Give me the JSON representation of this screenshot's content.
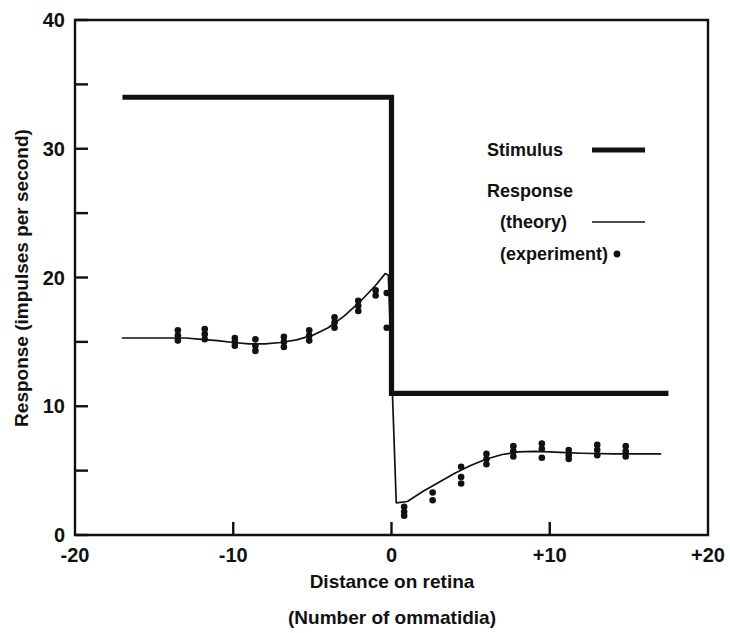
{
  "chart_data": {
    "type": "line",
    "title": "",
    "subtitle": "",
    "xlabel": "Distance on retina",
    "xlabel_sub": "(Number of ommatidia)",
    "ylabel": "Response (impulses per second)",
    "xlim": [
      -20,
      20
    ],
    "ylim": [
      0,
      40
    ],
    "grid": false,
    "x_ticks_major": [
      -20,
      -10,
      0,
      10,
      20
    ],
    "x_tick_labels": [
      "-20",
      "-10",
      "0",
      "+10",
      "+20"
    ],
    "y_ticks_major": [
      0,
      10,
      20,
      30,
      40
    ],
    "y_tick_labels": [
      "0",
      "10",
      "20",
      "30",
      "40"
    ],
    "y_ticks_minor": [
      5,
      15,
      25,
      35
    ],
    "legend_position": "upper-right-inside",
    "legend": [
      {
        "label": "Stimulus",
        "style": "thick-line"
      },
      {
        "label": "Response",
        "style": "group-header"
      },
      {
        "label": "(theory)",
        "style": "thin-line"
      },
      {
        "label": "(experiment)",
        "style": "dot"
      }
    ],
    "series": [
      {
        "name": "Stimulus",
        "style": "thick-line",
        "description": "Step stimulus: high level 34 impulses/sec for x < 0, low level 11 impulses/sec for x > 0",
        "high_level": 34,
        "low_level": 11,
        "step_x": 0,
        "x_start": -17,
        "x_end": 17.5,
        "points": [
          {
            "x": -17,
            "y": 34
          },
          {
            "x": 0,
            "y": 34
          },
          {
            "x": 0,
            "y": 11
          },
          {
            "x": 17.5,
            "y": 11
          }
        ]
      },
      {
        "name": "Response (theory)",
        "style": "thin-line",
        "description": "Predicted response curve showing Mach bands: dip near x=-9 and peak just left of the step, undershoot just right of the step and overshoot near x=+8",
        "points": [
          {
            "x": -17,
            "y": 15.3
          },
          {
            "x": -15,
            "y": 15.3
          },
          {
            "x": -13,
            "y": 15.3
          },
          {
            "x": -12,
            "y": 15.2
          },
          {
            "x": -11,
            "y": 15.1
          },
          {
            "x": -10,
            "y": 14.95
          },
          {
            "x": -9,
            "y": 14.85
          },
          {
            "x": -8,
            "y": 14.85
          },
          {
            "x": -7,
            "y": 14.95
          },
          {
            "x": -6,
            "y": 15.15
          },
          {
            "x": -5,
            "y": 15.5
          },
          {
            "x": -4,
            "y": 16.1
          },
          {
            "x": -3,
            "y": 17.0
          },
          {
            "x": -2,
            "y": 18.1
          },
          {
            "x": -1,
            "y": 19.4
          },
          {
            "x": -0.4,
            "y": 20.3
          },
          {
            "x": -0.2,
            "y": 20.2
          },
          {
            "x": 0.3,
            "y": 2.5
          },
          {
            "x": 1,
            "y": 2.6
          },
          {
            "x": 2,
            "y": 3.4
          },
          {
            "x": 3,
            "y": 4.1
          },
          {
            "x": 4,
            "y": 4.8
          },
          {
            "x": 5,
            "y": 5.4
          },
          {
            "x": 6,
            "y": 5.9
          },
          {
            "x": 7,
            "y": 6.25
          },
          {
            "x": 8,
            "y": 6.45
          },
          {
            "x": 9,
            "y": 6.5
          },
          {
            "x": 10,
            "y": 6.45
          },
          {
            "x": 11,
            "y": 6.4
          },
          {
            "x": 12,
            "y": 6.35
          },
          {
            "x": 14,
            "y": 6.3
          },
          {
            "x": 17,
            "y": 6.3
          }
        ]
      },
      {
        "name": "Response (experiment)",
        "style": "dots",
        "description": "Measured responses; several repeated measurements are plotted at each ommatidium position",
        "points": [
          {
            "x": -13.5,
            "y": 15.9
          },
          {
            "x": -13.5,
            "y": 15.5
          },
          {
            "x": -13.5,
            "y": 15.1
          },
          {
            "x": -11.8,
            "y": 16.0
          },
          {
            "x": -11.8,
            "y": 15.6
          },
          {
            "x": -11.8,
            "y": 15.2
          },
          {
            "x": -9.9,
            "y": 15.3
          },
          {
            "x": -9.9,
            "y": 15.0
          },
          {
            "x": -9.9,
            "y": 14.7
          },
          {
            "x": -8.6,
            "y": 15.2
          },
          {
            "x": -8.6,
            "y": 14.7
          },
          {
            "x": -8.6,
            "y": 14.3
          },
          {
            "x": -6.8,
            "y": 15.4
          },
          {
            "x": -6.8,
            "y": 15.0
          },
          {
            "x": -6.8,
            "y": 14.6
          },
          {
            "x": -5.2,
            "y": 15.9
          },
          {
            "x": -5.2,
            "y": 15.5
          },
          {
            "x": -5.2,
            "y": 15.1
          },
          {
            "x": -3.6,
            "y": 16.9
          },
          {
            "x": -3.6,
            "y": 16.5
          },
          {
            "x": -3.6,
            "y": 16.1
          },
          {
            "x": -2.1,
            "y": 18.2
          },
          {
            "x": -2.1,
            "y": 17.8
          },
          {
            "x": -2.1,
            "y": 17.4
          },
          {
            "x": -1.0,
            "y": 19.0
          },
          {
            "x": -1.0,
            "y": 18.6
          },
          {
            "x": -0.3,
            "y": 18.8
          },
          {
            "x": -0.3,
            "y": 16.1
          },
          {
            "x": 0.8,
            "y": 2.2
          },
          {
            "x": 0.8,
            "y": 1.8
          },
          {
            "x": 0.8,
            "y": 1.5
          },
          {
            "x": 2.6,
            "y": 3.3
          },
          {
            "x": 2.6,
            "y": 2.7
          },
          {
            "x": 4.4,
            "y": 5.3
          },
          {
            "x": 4.4,
            "y": 4.5
          },
          {
            "x": 4.4,
            "y": 4.0
          },
          {
            "x": 6.0,
            "y": 6.3
          },
          {
            "x": 6.0,
            "y": 5.9
          },
          {
            "x": 6.0,
            "y": 5.5
          },
          {
            "x": 7.7,
            "y": 6.9
          },
          {
            "x": 7.7,
            "y": 6.5
          },
          {
            "x": 7.7,
            "y": 6.1
          },
          {
            "x": 9.5,
            "y": 7.1
          },
          {
            "x": 9.5,
            "y": 6.7
          },
          {
            "x": 9.5,
            "y": 6.0
          },
          {
            "x": 11.2,
            "y": 6.6
          },
          {
            "x": 11.2,
            "y": 6.2
          },
          {
            "x": 11.2,
            "y": 5.9
          },
          {
            "x": 13.0,
            "y": 7.0
          },
          {
            "x": 13.0,
            "y": 6.6
          },
          {
            "x": 13.0,
            "y": 6.2
          },
          {
            "x": 14.8,
            "y": 6.9
          },
          {
            "x": 14.8,
            "y": 6.5
          },
          {
            "x": 14.8,
            "y": 6.1
          }
        ]
      }
    ]
  }
}
